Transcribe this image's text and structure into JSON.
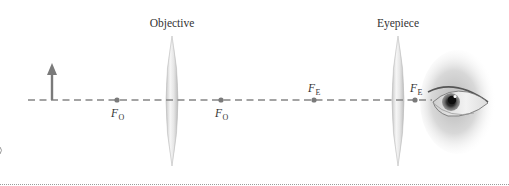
{
  "diagram": {
    "type": "compound-microscope-ray-setup",
    "colors": {
      "axis": "#808080",
      "object_arrow": "#7a7a7a",
      "focal_point": "#7a7a7a",
      "lens_fill_light": "#f4f4f4",
      "lens_fill_dark": "#c8c8c8",
      "text": "#333333",
      "bottom_rule": "#9a9a9a"
    },
    "lenses": [
      {
        "id": "objective",
        "label": "Objective",
        "cx": 172
      },
      {
        "id": "eyepiece",
        "label": "Eyepiece",
        "cx": 398
      }
    ],
    "focal_points": [
      {
        "id": "fo-left",
        "symbol": "F",
        "subscript": "O",
        "x": 117,
        "label_position": "below"
      },
      {
        "id": "fo-right",
        "symbol": "F",
        "subscript": "O",
        "x": 221,
        "label_position": "below"
      },
      {
        "id": "fe-left",
        "symbol": "F",
        "subscript": "E",
        "x": 314,
        "label_position": "above"
      },
      {
        "id": "fe-right",
        "symbol": "F",
        "subscript": "E",
        "x": 415,
        "label_position": "above"
      }
    ],
    "object": {
      "label": "",
      "x": 52
    },
    "eye": {
      "label": ""
    }
  }
}
